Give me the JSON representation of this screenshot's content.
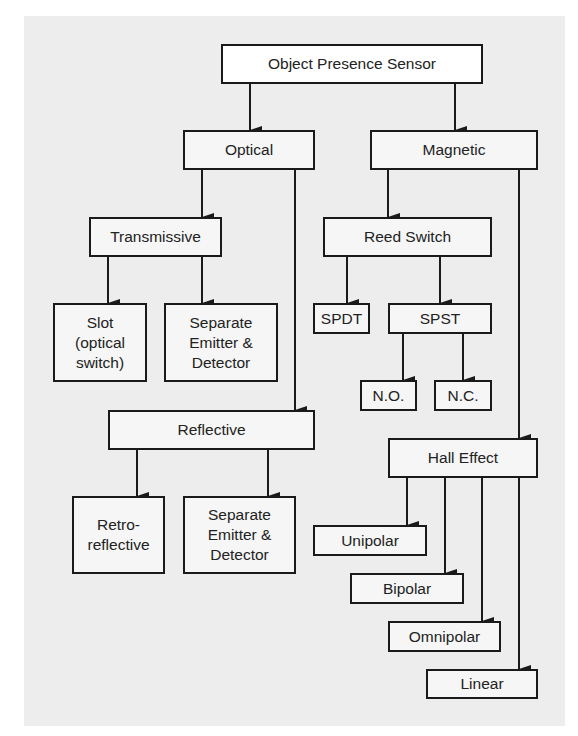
{
  "diagram": {
    "root": "Object Presence Sensor",
    "optical": "Optical",
    "magnetic": "Magnetic",
    "transmissive": "Transmissive",
    "slot": "Slot (optical switch)",
    "slot_lines": [
      "Slot",
      "(optical",
      "switch)"
    ],
    "trans_separate_lines": [
      "Separate",
      "Emitter &",
      "Detector"
    ],
    "reflective": "Reflective",
    "retro_lines": [
      "Retro-",
      "reflective"
    ],
    "refl_separate_lines": [
      "Separate",
      "Emitter &",
      "Detector"
    ],
    "reed_switch": "Reed Switch",
    "spdt": "SPDT",
    "spst": "SPST",
    "no": "N.O.",
    "nc": "N.C.",
    "hall_effect": "Hall Effect",
    "unipolar": "Unipolar",
    "bipolar": "Bipolar",
    "omnipolar": "Omnipolar",
    "linear": "Linear"
  },
  "colors": {
    "panel": "#ededed",
    "stroke": "#1a1a1a",
    "box": "#f6f6f6"
  }
}
